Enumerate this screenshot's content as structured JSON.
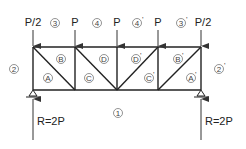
{
  "truss": {
    "loads": [
      {
        "label": "P/2",
        "x": 33
      },
      {
        "label": "P",
        "x": 75
      },
      {
        "label": "P",
        "x": 117
      },
      {
        "label": "P",
        "x": 158
      },
      {
        "label": "P/2",
        "x": 201
      }
    ],
    "reactions": [
      {
        "label": "R=2P",
        "x": 33
      },
      {
        "label": "R=2P",
        "x": 201
      }
    ],
    "space_labels": {
      "outer": [
        {
          "text": "1",
          "suffix": "",
          "x": 118,
          "y": 113
        },
        {
          "text": "2",
          "suffix": "",
          "x": 14,
          "y": 69
        },
        {
          "text": "3",
          "suffix": "",
          "x": 55,
          "y": 23
        },
        {
          "text": "4",
          "suffix": "",
          "x": 97,
          "y": 23
        },
        {
          "text": "4",
          "suffix": "'",
          "x": 137,
          "y": 23
        },
        {
          "text": "3",
          "suffix": "'",
          "x": 181,
          "y": 23
        },
        {
          "text": "2",
          "suffix": "'",
          "x": 219,
          "y": 69
        }
      ],
      "inner": [
        {
          "text": "A",
          "suffix": "",
          "x": 48,
          "y": 78
        },
        {
          "text": "B",
          "suffix": "",
          "x": 61,
          "y": 59
        },
        {
          "text": "C",
          "suffix": "",
          "x": 89,
          "y": 78
        },
        {
          "text": "D",
          "suffix": "",
          "x": 104,
          "y": 59
        },
        {
          "text": "D",
          "suffix": "'",
          "x": 136,
          "y": 59
        },
        {
          "text": "C",
          "suffix": "'",
          "x": 149,
          "y": 78
        },
        {
          "text": "B",
          "suffix": "'",
          "x": 178,
          "y": 59
        },
        {
          "text": "A",
          "suffix": "'",
          "x": 191,
          "y": 78
        }
      ]
    }
  }
}
